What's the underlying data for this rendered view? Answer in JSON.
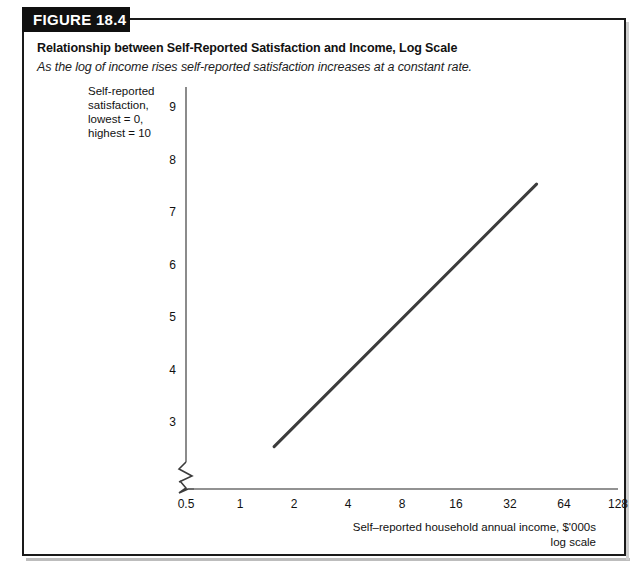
{
  "figure": {
    "badge_label": "FIGURE 18.4",
    "title": "Relationship between Self-Reported Satisfaction and Income, Log Scale",
    "subtitle": "As the log of income rises self-reported satisfaction increases at a constant rate."
  },
  "chart_data": {
    "type": "line",
    "title": "Relationship between Self-Reported Satisfaction and Income, Log Scale",
    "subtitle": "As the log of income rises self-reported satisfaction increases at a constant rate.",
    "xlabel": "Self–reported household annual income, $'000s",
    "xlabel_line2": "log scale",
    "ylabel_lines": [
      "Self-reported",
      "satisfaction,",
      "lowest = 0,",
      "highest = 10"
    ],
    "x_scale": "log2",
    "x_ticks": [
      0.5,
      1,
      2,
      4,
      8,
      16,
      32,
      64,
      128
    ],
    "x_tick_labels": [
      "0.5",
      "1",
      "2",
      "4",
      "8",
      "16",
      "32",
      "64",
      "128"
    ],
    "y_ticks": [
      3,
      4,
      5,
      6,
      7,
      8,
      9
    ],
    "y_tick_labels": [
      "3",
      "4",
      "5",
      "6",
      "7",
      "8",
      "9"
    ],
    "xlim": [
      0.5,
      128
    ],
    "ylim": [
      2.0,
      9.4
    ],
    "grid": false,
    "legend": false,
    "axis_break_x": true,
    "axis_break_y": true,
    "series": [
      {
        "name": "Self-reported satisfaction",
        "color": "#3c3c3c",
        "line_width": 3,
        "points": [
          {
            "x": 1.55,
            "y": 2.55
          },
          {
            "x": 45.0,
            "y": 7.55
          }
        ]
      }
    ],
    "axis_color": "#6e6e6e",
    "text_color": "#111111"
  },
  "icons": {
    "axis_break": "axis-break-zigzag"
  }
}
